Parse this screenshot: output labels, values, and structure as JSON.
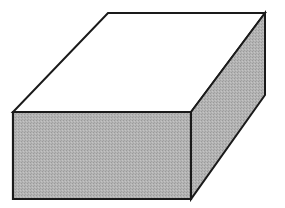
{
  "diagram": {
    "type": "isometric-box",
    "colors": {
      "background": "#ffffff",
      "top_face": "#ffffff",
      "front_face": "#b0b0b0",
      "side_face": "#b0b0b0",
      "stroke": "#1a1a1a"
    },
    "stroke_width": 2,
    "vertices": {
      "top_back_left": [
        108,
        13
      ],
      "top_back_right": [
        265,
        13
      ],
      "front_top_left": [
        13,
        112
      ],
      "front_top_right": [
        191,
        112
      ],
      "front_bottom_left": [
        13,
        199
      ],
      "front_bottom_right": [
        191,
        199
      ],
      "back_bottom_right": [
        265,
        95
      ]
    },
    "faces": {
      "top": "108,13 265,13 191,112 13,112",
      "front": "13,112 191,112 191,199 13,199",
      "side": "191,112 265,13 265,95 191,199"
    }
  }
}
